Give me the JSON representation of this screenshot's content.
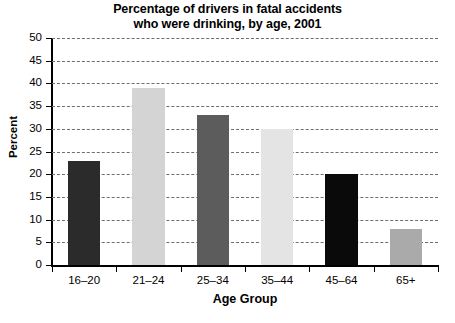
{
  "chart_data": {
    "type": "bar",
    "title": "Percentage of drivers in fatal accidents who were drinking, by age, 2001",
    "title_lines": [
      "Percentage of drivers in fatal accidents",
      "who were drinking, by age, 2001"
    ],
    "xlabel": "Age Group",
    "ylabel": "Percent",
    "categories": [
      "16–20",
      "21–24",
      "25–34",
      "35–44",
      "45–64",
      "65+"
    ],
    "values": [
      23,
      39,
      33,
      30,
      20,
      8
    ],
    "ylim": [
      0,
      50
    ],
    "ytick_step": 5,
    "ytick_labels": [
      "0",
      "5",
      "10",
      "15",
      "20",
      "25",
      "30",
      "35",
      "40",
      "45",
      "50"
    ],
    "grid": "horizontal-dashed",
    "legend": "none",
    "bar_colors": [
      "#2b2b2b",
      "#d4d4d4",
      "#5c5c5c",
      "#e4e4e4",
      "#0a0a0a",
      "#aaaaaa"
    ],
    "axis_color": "#000000",
    "gridline_color": "#6e6e6e",
    "background": "#ffffff"
  }
}
